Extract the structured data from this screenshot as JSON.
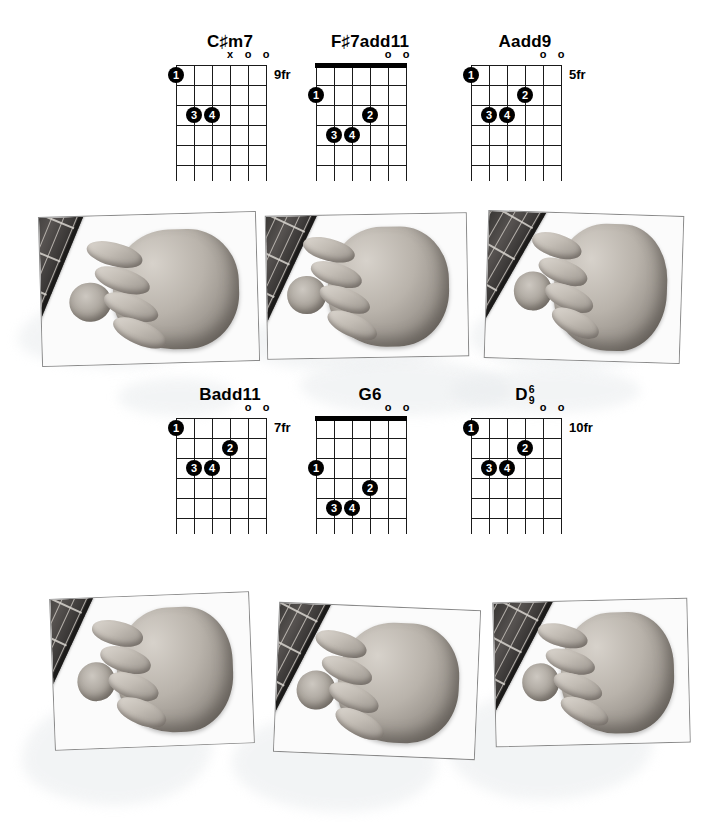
{
  "page": {
    "layout": "two rows of three chord diagrams, each followed by a row of three photographs"
  },
  "diagrams": [
    {
      "name": "chord-c-sharp-m7",
      "title_main": "C",
      "title_accidental": "#",
      "title_suffix": "m7",
      "title_plain": "C#m7",
      "fret_label": "9fr",
      "nut": false,
      "strings": 6,
      "frets": 5,
      "top_markers": [
        {
          "string": 3,
          "symbol": "x"
        },
        {
          "string": 2,
          "symbol": "o"
        },
        {
          "string": 1,
          "symbol": "o"
        }
      ],
      "fingers": [
        {
          "finger": "1",
          "string": 6,
          "fret": 1
        },
        {
          "finger": "3",
          "string": 5,
          "fret": 3
        },
        {
          "finger": "4",
          "string": 4,
          "fret": 3
        }
      ]
    },
    {
      "name": "chord-f-sharp-7add11",
      "title_main": "F",
      "title_accidental": "#",
      "title_suffix": "7add11",
      "title_plain": "F#7add11",
      "fret_label": "",
      "nut": true,
      "strings": 6,
      "frets": 5,
      "top_markers": [
        {
          "string": 2,
          "symbol": "o"
        },
        {
          "string": 1,
          "symbol": "o"
        }
      ],
      "fingers": [
        {
          "finger": "1",
          "string": 6,
          "fret": 2
        },
        {
          "finger": "2",
          "string": 3,
          "fret": 3
        },
        {
          "finger": "3",
          "string": 5,
          "fret": 4
        },
        {
          "finger": "4",
          "string": 4,
          "fret": 4
        }
      ]
    },
    {
      "name": "chord-aadd9",
      "title_main": "A",
      "title_accidental": "",
      "title_suffix": "add9",
      "title_plain": "Aadd9",
      "fret_label": "5fr",
      "nut": false,
      "strings": 6,
      "frets": 5,
      "top_markers": [
        {
          "string": 2,
          "symbol": "o"
        },
        {
          "string": 1,
          "symbol": "o"
        }
      ],
      "fingers": [
        {
          "finger": "1",
          "string": 6,
          "fret": 1
        },
        {
          "finger": "2",
          "string": 3,
          "fret": 2
        },
        {
          "finger": "3",
          "string": 5,
          "fret": 3
        },
        {
          "finger": "4",
          "string": 4,
          "fret": 3
        }
      ]
    },
    {
      "name": "chord-badd11",
      "title_main": "B",
      "title_accidental": "",
      "title_suffix": "add11",
      "title_plain": "Badd11",
      "fret_label": "7fr",
      "nut": false,
      "strings": 6,
      "frets": 5,
      "top_markers": [
        {
          "string": 2,
          "symbol": "o"
        },
        {
          "string": 1,
          "symbol": "o"
        }
      ],
      "fingers": [
        {
          "finger": "1",
          "string": 6,
          "fret": 1
        },
        {
          "finger": "2",
          "string": 3,
          "fret": 2
        },
        {
          "finger": "3",
          "string": 5,
          "fret": 3
        },
        {
          "finger": "4",
          "string": 4,
          "fret": 3
        }
      ]
    },
    {
      "name": "chord-g6",
      "title_main": "G",
      "title_accidental": "",
      "title_suffix": "6",
      "title_plain": "G6",
      "fret_label": "",
      "nut": true,
      "strings": 6,
      "frets": 5,
      "top_markers": [
        {
          "string": 2,
          "symbol": "o"
        },
        {
          "string": 1,
          "symbol": "o"
        }
      ],
      "fingers": [
        {
          "finger": "1",
          "string": 6,
          "fret": 3
        },
        {
          "finger": "2",
          "string": 3,
          "fret": 4
        },
        {
          "finger": "3",
          "string": 5,
          "fret": 5
        },
        {
          "finger": "4",
          "string": 4,
          "fret": 5
        }
      ]
    },
    {
      "name": "chord-d-6-9",
      "title_main": "D",
      "title_accidental": "",
      "title_suffix": "",
      "title_stack_top": "6",
      "title_stack_bottom": "9",
      "title_plain": "D6/9",
      "fret_label": "10fr",
      "nut": false,
      "strings": 6,
      "frets": 5,
      "top_markers": [
        {
          "string": 2,
          "symbol": "o"
        },
        {
          "string": 1,
          "symbol": "o"
        }
      ],
      "fingers": [
        {
          "finger": "1",
          "string": 6,
          "fret": 1
        },
        {
          "finger": "2",
          "string": 3,
          "fret": 2
        },
        {
          "finger": "3",
          "string": 5,
          "fret": 3
        },
        {
          "finger": "4",
          "string": 4,
          "fret": 3
        }
      ]
    }
  ],
  "photos": [
    {
      "name": "photo-c-sharp-m7",
      "alt": "hand fretting C#m7 on guitar neck",
      "rotate": -1.6
    },
    {
      "name": "photo-f-sharp-7add11",
      "alt": "hand fretting F#7add11 on guitar neck",
      "rotate": -1.0
    },
    {
      "name": "photo-aadd9",
      "alt": "hand fretting Aadd9 on guitar neck",
      "rotate": 1.8
    },
    {
      "name": "photo-badd11",
      "alt": "hand fretting Badd11 on guitar neck",
      "rotate": -2.2
    },
    {
      "name": "photo-g6",
      "alt": "hand fretting G6 on guitar neck",
      "rotate": 2.4
    },
    {
      "name": "photo-d-6-9",
      "alt": "hand fretting D6/9 on guitar neck",
      "rotate": -1.4
    }
  ],
  "colors": {
    "ink": "#000000",
    "grid_line": "#1a1a1a",
    "photo_border": "#8a8a8a",
    "wash": "#e9ecee",
    "paper": "#ffffff"
  }
}
